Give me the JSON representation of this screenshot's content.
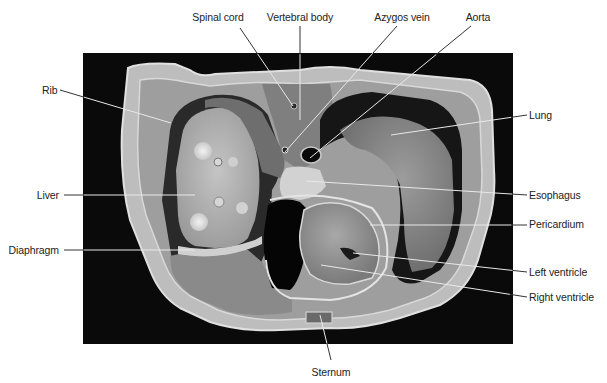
{
  "figure": {
    "photo": {
      "x": 83,
      "y": 53,
      "width": 430,
      "height": 291,
      "background": "#0a0a0a"
    },
    "colors": {
      "label_text": "#222222",
      "leader_on_white": "#333333",
      "leader_on_dark": "#e8e8e8",
      "tissue_light": "#cfcfcf",
      "tissue_mid": "#8e8e8e",
      "tissue_dark": "#5e5e5e",
      "cavity": "#0d0d0d"
    }
  },
  "labels": {
    "spinal_cord": {
      "text": "Spinal cord",
      "x": 218,
      "y": 11,
      "align": "center",
      "line": [
        [
          240,
          28
        ],
        [
          293,
          106
        ]
      ]
    },
    "vertebral_body": {
      "text": "Vertebral body",
      "x": 300,
      "y": 11,
      "align": "center",
      "line": [
        [
          300,
          26
        ],
        [
          300,
          120
        ]
      ]
    },
    "azygos_vein": {
      "text": "Azygos vein",
      "x": 402,
      "y": 11,
      "align": "center",
      "line": [
        [
          397,
          26
        ],
        [
          285,
          152
        ]
      ]
    },
    "aorta": {
      "text": "Aorta",
      "x": 478,
      "y": 11,
      "align": "center",
      "line": [
        [
          471,
          26
        ],
        [
          310,
          158
        ]
      ]
    },
    "rib": {
      "text": "Rib",
      "x": 42,
      "y": 84,
      "align": "left",
      "line": [
        [
          60,
          90
        ],
        [
          171,
          123
        ]
      ]
    },
    "lung": {
      "text": "Lung",
      "x": 529,
      "y": 109,
      "align": "left",
      "line": [
        [
          527,
          115
        ],
        [
          391,
          135
        ]
      ]
    },
    "liver": {
      "text": "Liver",
      "x": 59,
      "y": 189,
      "align": "right",
      "line": [
        [
          64,
          195
        ],
        [
          195,
          195
        ]
      ]
    },
    "esophagus": {
      "text": "Esophagus",
      "x": 529,
      "y": 189,
      "align": "left",
      "line": [
        [
          527,
          195
        ],
        [
          306,
          181
        ]
      ]
    },
    "pericardium": {
      "text": "Pericardium",
      "x": 529,
      "y": 218,
      "align": "left",
      "line": [
        [
          527,
          225
        ],
        [
          370,
          225
        ]
      ]
    },
    "diaphragm": {
      "text": "Diaphragm",
      "x": 59,
      "y": 244,
      "align": "right",
      "line": [
        [
          64,
          250
        ],
        [
          195,
          250
        ]
      ]
    },
    "left_ventricle": {
      "text": "Left ventricle",
      "x": 529,
      "y": 266,
      "align": "left",
      "line": [
        [
          527,
          272
        ],
        [
          353,
          253
        ]
      ]
    },
    "right_ventricle": {
      "text": "Right ventricle",
      "x": 529,
      "y": 291,
      "align": "left",
      "line": [
        [
          527,
          297
        ],
        [
          321,
          265
        ]
      ]
    },
    "sternum": {
      "text": "Sternum",
      "x": 331,
      "y": 366,
      "align": "center",
      "line": [
        [
          331,
          360
        ],
        [
          320,
          315
        ]
      ]
    }
  }
}
